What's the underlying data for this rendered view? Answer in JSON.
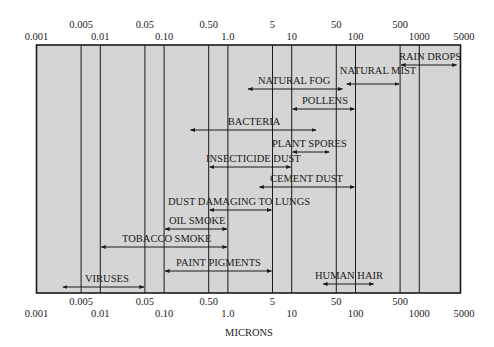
{
  "chart_data": {
    "type": "range-bar",
    "title": "",
    "xlabel": "MICRONS",
    "ylabel": "",
    "xscale": "log",
    "xlim": [
      0.001,
      5000
    ],
    "grid": "vertical lines at 0.005, 0.01, 0.05, 0.10, 0.50, 1.0, 5, 10, 50, 100, 500, 1000",
    "gridlines": [
      0.005,
      0.01,
      0.05,
      0.1,
      0.5,
      1,
      5,
      10,
      50,
      100,
      500,
      1000
    ],
    "ticks_upper_row": [
      {
        "value": 0.005,
        "label": "0.005"
      },
      {
        "value": 0.05,
        "label": "0.05"
      },
      {
        "value": 0.5,
        "label": "0.50"
      },
      {
        "value": 5,
        "label": "5"
      },
      {
        "value": 50,
        "label": "50"
      },
      {
        "value": 500,
        "label": "500"
      }
    ],
    "ticks_lower_row": [
      {
        "value": 0.001,
        "label": "0.001"
      },
      {
        "value": 0.01,
        "label": "0.01"
      },
      {
        "value": 0.1,
        "label": "0.10"
      },
      {
        "value": 1,
        "label": "1.0"
      },
      {
        "value": 10,
        "label": "10"
      },
      {
        "value": 100,
        "label": "100"
      },
      {
        "value": 1000,
        "label": "1000"
      },
      {
        "value": 5000,
        "label": "5000"
      }
    ],
    "series": [
      {
        "name": "RAIN DROPS",
        "min": 500,
        "max": 4000
      },
      {
        "name": "NATURAL MIST",
        "min": 70,
        "max": 500
      },
      {
        "name": "NATURAL FOG",
        "min": 2,
        "max": 65
      },
      {
        "name": "POLLENS",
        "min": 10,
        "max": 100
      },
      {
        "name": "BACTERIA",
        "min": 0.25,
        "max": 25
      },
      {
        "name": "PLANT SPORES",
        "min": 10,
        "max": 40
      },
      {
        "name": "INSECTICIDE DUST",
        "min": 0.5,
        "max": 10
      },
      {
        "name": "CEMENT DUST",
        "min": 3,
        "max": 100
      },
      {
        "name": "DUST DAMAGING TO LUNGS",
        "min": 0.5,
        "max": 5
      },
      {
        "name": "OIL SMOKE",
        "min": 0.1,
        "max": 1
      },
      {
        "name": "TOBACCO SMOKE",
        "min": 0.01,
        "max": 1
      },
      {
        "name": "PAINT PIGMENTS",
        "min": 0.1,
        "max": 5
      },
      {
        "name": "VIRUSES",
        "min": 0.0025,
        "max": 0.05
      },
      {
        "name": "HUMAN HAIR",
        "min": 30,
        "max": 200
      }
    ]
  },
  "colors": {
    "plot_background": "#d5d5d5",
    "lines": "#1a1a1a"
  }
}
